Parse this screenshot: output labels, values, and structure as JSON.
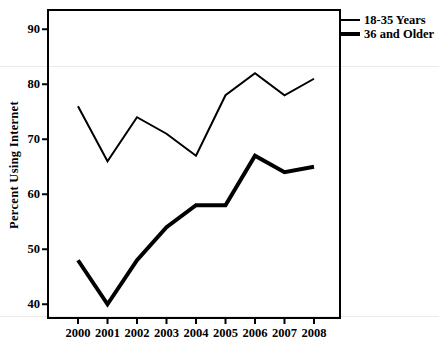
{
  "figure": {
    "ylabel": "Percent Using Internet",
    "legend": [
      {
        "label": "18-35 Years",
        "style": "thin"
      },
      {
        "label": "36 and Older",
        "style": "thick"
      }
    ]
  },
  "chart_data": {
    "type": "line",
    "x": [
      2000,
      2001,
      2002,
      2003,
      2004,
      2005,
      2006,
      2007,
      2008
    ],
    "series": [
      {
        "name": "18-35 Years",
        "values": [
          76,
          66,
          74,
          71,
          67,
          78,
          82,
          78,
          81
        ],
        "line_weight": "thin"
      },
      {
        "name": "36 and Older",
        "values": [
          48,
          40,
          48,
          54,
          58,
          58,
          67,
          64,
          65
        ],
        "line_weight": "thick"
      }
    ],
    "title": "",
    "xlabel": "",
    "ylabel": "Percent Using Internet",
    "yticks": [
      40,
      50,
      60,
      70,
      80,
      90
    ],
    "ylim": [
      37.5,
      93.5
    ],
    "grid": false,
    "legend_position": "top-right-outside",
    "line_color": "#000000",
    "background_color": "#ffffff"
  }
}
